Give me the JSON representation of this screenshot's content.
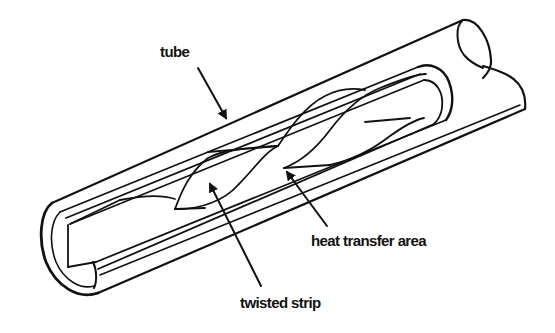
{
  "diagram": {
    "labels": {
      "tube": "tube",
      "heat_transfer_area": "heat transfer area",
      "twisted_strip": "twisted strip"
    },
    "colors": {
      "line": "#111111",
      "background": "#ffffff"
    },
    "arrows": [
      {
        "label": "tube",
        "from": [
          198,
          68
        ],
        "to": [
          228,
          122
        ]
      },
      {
        "label": "heat transfer area",
        "from": [
          327,
          226
        ],
        "to": [
          284,
          168
        ]
      },
      {
        "label": "twisted strip",
        "from": [
          261,
          286
        ],
        "to": [
          208,
          180
        ]
      }
    ]
  }
}
